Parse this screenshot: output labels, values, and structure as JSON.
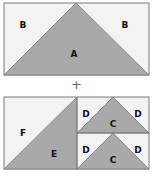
{
  "colors": {
    "dark_fill": "#a9a9a9",
    "light_fill": "#f3f3f3",
    "stroke": "#7a7a7a",
    "plus": "#666666"
  },
  "top_panel": {
    "labels": {
      "left_corner": "B",
      "right_corner": "B",
      "center_triangle": "A"
    }
  },
  "operator": "+",
  "bottom_panel": {
    "left_block": {
      "upper_triangle": "F",
      "lower_triangle": "E"
    },
    "right_blocks": [
      {
        "left_corner": "D",
        "center_triangle": "C",
        "right_corner": "D"
      },
      {
        "left_corner": "D",
        "center_triangle": "C",
        "right_corner": "D"
      }
    ]
  }
}
